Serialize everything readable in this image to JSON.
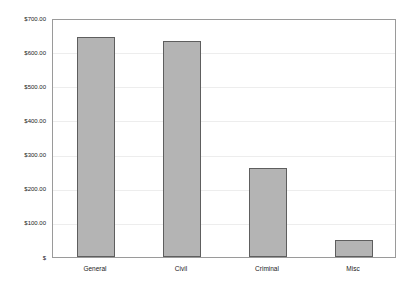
{
  "chart_data": {
    "type": "bar",
    "title": "",
    "xlabel": "",
    "ylabel": "",
    "categories": [
      "General",
      "Civil",
      "Criminal",
      "Misc"
    ],
    "values": [
      643.0,
      634.0,
      261.0,
      50.0
    ],
    "ylim": [
      0,
      700
    ],
    "ytick_values": [
      0,
      100,
      200,
      300,
      400,
      500,
      600,
      700
    ],
    "ytick_labels": [
      "$",
      "$100.00",
      "$200.00",
      "$300.00",
      "$400.00",
      "$500.00",
      "$600.00",
      "$700.00"
    ],
    "grid": true,
    "legend": null,
    "bar_fill_color": "#b4b4b4",
    "bar_border_color": "#5e5e5e",
    "plot_border_color": "#9a9a9a",
    "gridline_color": "#ededed",
    "background_color": "#ffffff"
  }
}
